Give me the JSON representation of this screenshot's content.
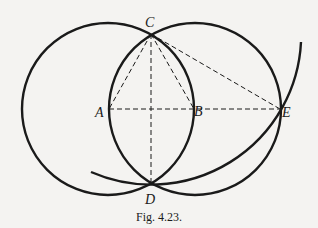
{
  "figure": {
    "caption": "Fig. 4.23.",
    "points": {
      "A": {
        "label": "A",
        "x": 109,
        "y": 109
      },
      "B": {
        "label": "B",
        "x": 194,
        "y": 109
      },
      "C": {
        "label": "C",
        "x": 151,
        "y": 34
      },
      "D": {
        "label": "D",
        "x": 151,
        "y": 184
      },
      "E": {
        "label": "E",
        "x": 280,
        "y": 109
      }
    },
    "circles": [
      {
        "name": "circle-center-A",
        "center": "A",
        "radius": 86
      },
      {
        "name": "circle-center-B",
        "center": "B",
        "radius": 86
      }
    ],
    "arcs": [
      {
        "name": "arc-center-C-through-D-E",
        "center": "C",
        "radius": 150
      }
    ],
    "dashed_segments": [
      [
        "A",
        "E"
      ],
      [
        "C",
        "D"
      ],
      [
        "C",
        "A"
      ],
      [
        "C",
        "B"
      ],
      [
        "C",
        "E"
      ]
    ],
    "colors": {
      "stroke": "#1a1a1a",
      "background": "#f4f3f1"
    }
  }
}
